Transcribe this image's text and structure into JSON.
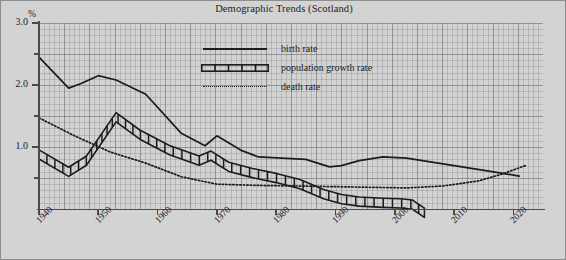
{
  "chart_data": {
    "type": "line",
    "title": "Demographic Trends (Scotland)",
    "xlabel": "",
    "ylabel": "%",
    "y_unit": "%",
    "xlim": [
      1940,
      2025
    ],
    "ylim": [
      0.0,
      3.0
    ],
    "grid": true,
    "legend_position": "top-center",
    "y_ticks_major": [
      "3.0",
      "2.0",
      "1.0"
    ],
    "y_tick_values_major": [
      3.0,
      2.0,
      1.0
    ],
    "y_tick_values_minor": [
      2.5,
      1.5,
      0.5
    ],
    "x_ticks": [
      "1940",
      "1950",
      "1960",
      "1970",
      "1980",
      "1990",
      "2000",
      "2010",
      "2020"
    ],
    "x_tick_values": [
      1940,
      1950,
      1960,
      1970,
      1980,
      1990,
      2000,
      2010,
      2020
    ],
    "series": [
      {
        "name": "birth rate",
        "style": "solid",
        "color": "#1c1c1c",
        "x": [
          1940,
          1945,
          1947,
          1950,
          1953,
          1958,
          1964,
          1968,
          1970,
          1974,
          1977,
          1981,
          1985,
          1989,
          1991,
          1994,
          1998,
          2002,
          2006,
          2010,
          2014,
          2018,
          2021
        ],
        "values": [
          2.45,
          1.95,
          2.02,
          2.15,
          2.08,
          1.85,
          1.22,
          1.02,
          1.18,
          0.95,
          0.84,
          0.82,
          0.8,
          0.68,
          0.7,
          0.78,
          0.84,
          0.82,
          0.76,
          0.7,
          0.64,
          0.58,
          0.53
        ]
      },
      {
        "name": "population growth rate",
        "style": "ladder",
        "color": "#1c1c1c",
        "x": [
          1940,
          1945,
          1948,
          1953,
          1957,
          1962,
          1967,
          1969,
          1972,
          1976,
          1980,
          1984,
          1988,
          1991,
          1994,
          1998,
          2001,
          2003,
          2005
        ],
        "values": [
          0.88,
          0.6,
          0.78,
          1.48,
          1.2,
          0.95,
          0.78,
          0.86,
          0.68,
          0.58,
          0.5,
          0.4,
          0.24,
          0.16,
          0.12,
          0.1,
          0.09,
          0.07,
          -0.06
        ]
      },
      {
        "name": "death rate",
        "style": "dotted",
        "color": "#1c1c1c",
        "x": [
          1940,
          1946,
          1952,
          1958,
          1964,
          1970,
          1977,
          1984,
          1990,
          1996,
          2002,
          2008,
          2014,
          2018,
          2022
        ],
        "values": [
          1.47,
          1.18,
          0.92,
          0.74,
          0.52,
          0.4,
          0.38,
          0.37,
          0.36,
          0.35,
          0.34,
          0.37,
          0.45,
          0.56,
          0.7
        ]
      }
    ]
  },
  "legend": {
    "items": [
      {
        "label": "birth rate",
        "style": "solid"
      },
      {
        "label": "population growth rate",
        "style": "ladder"
      },
      {
        "label": "death rate",
        "style": "dotted"
      }
    ]
  }
}
